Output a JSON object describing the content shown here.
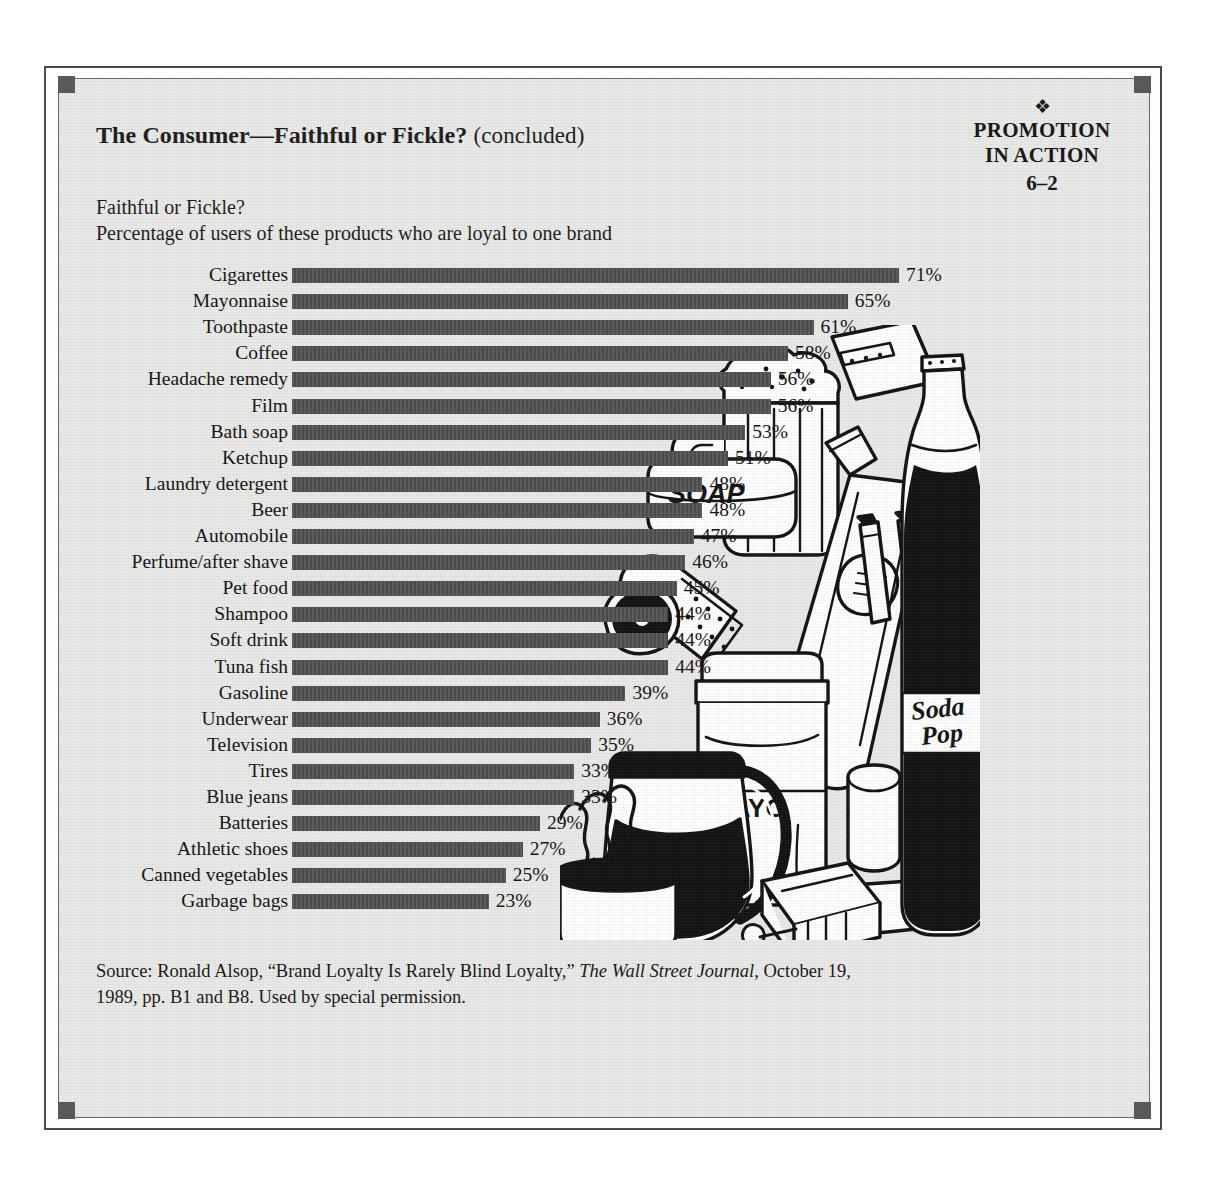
{
  "exhibit": {
    "title_main": "The Consumer—Faithful or Fickle?",
    "title_suffix": "(concluded)",
    "badge": {
      "ornament": "❖",
      "line1": "PROMOTION",
      "line2": "IN ACTION",
      "number": "6–2"
    },
    "subtitle": "Faithful or Fickle?",
    "description": "Percentage of users of these products who are loyal to one brand",
    "source": {
      "prefix": "Source: Ronald Alsop, “Brand Loyalty Is Rarely Blind Loyalty,” ",
      "publication": "The Wall Street Journal",
      "suffix": ", October 19, 1989, pp. B1 and B8. Used by special permission."
    }
  },
  "illustration": {
    "labels": {
      "soap": "SOAP",
      "mayo": "MAYO",
      "soda_line1": "Soda",
      "soda_line2": "Pop"
    },
    "items": [
      "beer-mug",
      "soap-bar",
      "toothpaste-tube",
      "film-roll",
      "mayonnaise-jar",
      "coffee-pot",
      "coffee-mug",
      "soda-bottle",
      "batteries",
      "cigarette-pack",
      "tissue-box"
    ]
  },
  "colors": {
    "bar": "#4d4d4d",
    "panel_bg": "#e9e9e7",
    "frame": "#4b4b4b",
    "text": "#111111"
  },
  "chart_data": {
    "type": "bar",
    "orientation": "horizontal",
    "title": "Faithful or Fickle?",
    "subtitle": "Percentage of users of these products who are loyal to one brand",
    "xlabel": "",
    "ylabel": "",
    "xlim": [
      0,
      71
    ],
    "grid": false,
    "legend": false,
    "value_suffix": "%",
    "categories": [
      "Cigarettes",
      "Mayonnaise",
      "Toothpaste",
      "Coffee",
      "Headache remedy",
      "Film",
      "Bath soap",
      "Ketchup",
      "Laundry detergent",
      "Beer",
      "Automobile",
      "Perfume/after shave",
      "Pet food",
      "Shampoo",
      "Soft drink",
      "Tuna fish",
      "Gasoline",
      "Underwear",
      "Television",
      "Tires",
      "Blue jeans",
      "Batteries",
      "Athletic shoes",
      "Canned vegetables",
      "Garbage bags"
    ],
    "values": [
      71,
      65,
      61,
      58,
      56,
      56,
      53,
      51,
      48,
      48,
      47,
      46,
      45,
      44,
      44,
      44,
      39,
      36,
      35,
      33,
      33,
      29,
      27,
      25,
      23
    ],
    "labels": [
      "71%",
      "65%",
      "61%",
      "58%",
      "56%",
      "56%",
      "53%",
      "51%",
      "48%",
      "48%",
      "47%",
      "46%",
      "45%",
      "44%",
      "44%",
      "44%",
      "39%",
      "36%",
      "35%",
      "33%",
      "33%",
      "29%",
      "27%",
      "25%",
      "23%"
    ]
  }
}
